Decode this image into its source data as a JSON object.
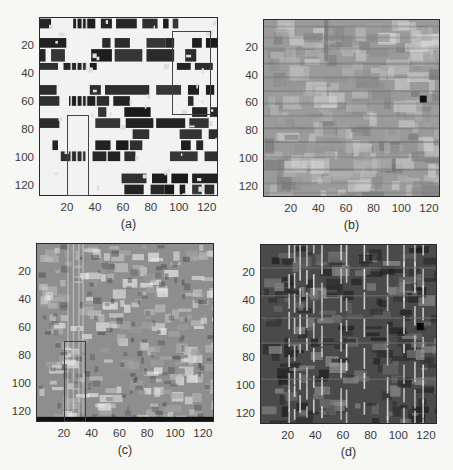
{
  "chart_data": [
    {
      "type": "heatmap",
      "panel": "a",
      "caption": "(a)",
      "title": "",
      "xlabel": "",
      "ylabel": "",
      "xlim": [
        0,
        128
      ],
      "ylim": [
        128,
        0
      ],
      "xticks": [
        20,
        40,
        60,
        80,
        100,
        120
      ],
      "yticks": [
        20,
        40,
        60,
        80,
        100,
        120
      ],
      "colormap": "gray",
      "style": "high-contrast binary block pattern",
      "rectangles": [
        {
          "x0": 95,
          "x1": 123,
          "y0": 10,
          "y1": 70
        },
        {
          "x0": 20,
          "x1": 36,
          "y0": 70,
          "y1": 128
        }
      ]
    },
    {
      "type": "heatmap",
      "panel": "b",
      "caption": "(b)",
      "title": "",
      "xlabel": "",
      "ylabel": "",
      "xlim": [
        0,
        128
      ],
      "ylim": [
        128,
        0
      ],
      "xticks": [
        20,
        40,
        60,
        80,
        100,
        120
      ],
      "yticks": [
        20,
        40,
        60,
        80,
        100,
        120
      ],
      "colormap": "gray",
      "style": "low-contrast mid-gray block texture",
      "annotations": [
        {
          "type": "dark-spot",
          "x": 117,
          "y": 58
        }
      ],
      "rectangles": []
    },
    {
      "type": "heatmap",
      "panel": "c",
      "caption": "(c)",
      "title": "",
      "xlabel": "",
      "ylabel": "",
      "xlim": [
        0,
        128
      ],
      "ylim": [
        128,
        0
      ],
      "xticks": [
        20,
        40,
        60,
        80,
        100,
        120
      ],
      "yticks": [
        20,
        40,
        60,
        80,
        100,
        120
      ],
      "colormap": "gray",
      "style": "smooth mid-gray texture with bright blobs",
      "rectangles": [
        {
          "x0": 20,
          "x1": 36,
          "y0": 70,
          "y1": 128
        }
      ]
    },
    {
      "type": "heatmap",
      "panel": "d",
      "caption": "(d)",
      "title": "",
      "xlabel": "",
      "ylabel": "",
      "xlim": [
        0,
        128
      ],
      "ylim": [
        128,
        0
      ],
      "xticks": [
        20,
        40,
        60,
        80,
        100,
        120
      ],
      "yticks": [
        20,
        40,
        60,
        80,
        100,
        120
      ],
      "colormap": "gray",
      "style": "dark texture with bright vertical stripes",
      "annotations": [
        {
          "type": "dark-spot",
          "x": 117,
          "y": 58
        }
      ],
      "rectangles": []
    }
  ],
  "panels": [
    {
      "id": "a",
      "caption": "(a)",
      "box": {
        "left": 39,
        "top": 17,
        "width": 179,
        "height": 179
      },
      "seed": 11,
      "mode": "binary"
    },
    {
      "id": "b",
      "caption": "(b)",
      "box": {
        "left": 263,
        "top": 19,
        "width": 177,
        "height": 178
      },
      "seed": 23,
      "mode": "soft"
    },
    {
      "id": "c",
      "caption": "(c)",
      "box": {
        "left": 36,
        "top": 243,
        "width": 178,
        "height": 179
      },
      "seed": 37,
      "mode": "smooth"
    },
    {
      "id": "d",
      "caption": "(d)",
      "box": {
        "left": 260,
        "top": 244,
        "width": 177,
        "height": 180
      },
      "seed": 41,
      "mode": "dark"
    }
  ],
  "tick_labels": [
    "20",
    "40",
    "60",
    "80",
    "100",
    "120"
  ],
  "tick_values": [
    20,
    40,
    60,
    80,
    100,
    120
  ],
  "axis_max": 128,
  "colors": {
    "frame": "#2a2a2a",
    "roi": "#444444",
    "background": "#f7f7f5",
    "text": "#333333"
  }
}
